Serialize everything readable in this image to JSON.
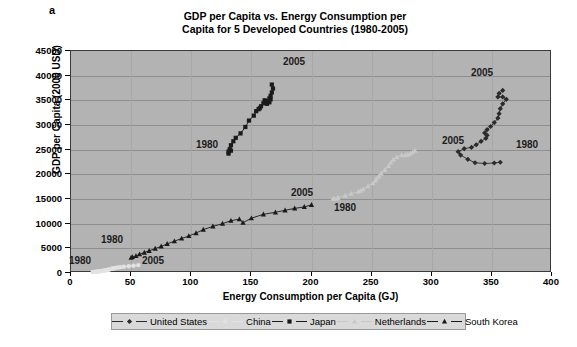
{
  "panel_letter": "a",
  "chart_data": {
    "type": "scatter",
    "title": "GDP per Capita vs. Energy Consumption per Capita for 5 Developed Countries (1980-2005)",
    "title_lines": [
      "GDP per Capita vs. Energy Consumption per",
      "Capita for 5 Developed Countries (1980-2005)"
    ],
    "xlabel": "Energy Consumption per Capita (GJ)",
    "ylabel": "GDP per Capita (2000 USD)",
    "xlim": [
      0,
      400
    ],
    "ylim": [
      0,
      45000
    ],
    "xticks": [
      0,
      50,
      100,
      150,
      200,
      250,
      300,
      350,
      400
    ],
    "yticks": [
      0,
      5000,
      10000,
      15000,
      20000,
      25000,
      30000,
      35000,
      40000,
      45000
    ],
    "grid": "horizontal",
    "legend_position": "bottom",
    "plot_background": "#b3b3b3",
    "series": [
      {
        "name": "United States",
        "marker": "diamond",
        "color": "#2b2b2b",
        "start_label": "1980",
        "end_label": "2005",
        "points": [
          [
            357,
            22450
          ],
          [
            352,
            22300
          ],
          [
            344,
            22200
          ],
          [
            336,
            22350
          ],
          [
            330,
            23050
          ],
          [
            324,
            23900
          ],
          [
            322,
            24600
          ],
          [
            327,
            25200
          ],
          [
            333,
            25450
          ],
          [
            337,
            26000
          ],
          [
            341,
            26700
          ],
          [
            345,
            27300
          ],
          [
            346,
            27900
          ],
          [
            344,
            28400
          ],
          [
            346,
            29050
          ],
          [
            349,
            29700
          ],
          [
            352,
            30500
          ],
          [
            355,
            31400
          ],
          [
            356,
            32300
          ],
          [
            357,
            33300
          ],
          [
            359,
            34300
          ],
          [
            362,
            35200
          ],
          [
            359,
            35700
          ],
          [
            355,
            35700
          ],
          [
            356,
            36400
          ],
          [
            359,
            37000
          ]
        ]
      },
      {
        "name": "China",
        "marker": "circle",
        "color": "#e2e2e2",
        "start_label": "1980",
        "end_label": "2005",
        "points": [
          [
            18,
            190
          ],
          [
            19,
            210
          ],
          [
            20,
            235
          ],
          [
            21,
            260
          ],
          [
            22,
            290
          ],
          [
            23,
            320
          ],
          [
            24,
            355
          ],
          [
            25,
            395
          ],
          [
            26,
            430
          ],
          [
            27,
            470
          ],
          [
            28,
            510
          ],
          [
            29,
            560
          ],
          [
            30,
            610
          ],
          [
            31,
            670
          ],
          [
            32,
            730
          ],
          [
            33,
            790
          ],
          [
            34,
            850
          ],
          [
            35,
            910
          ],
          [
            36,
            970
          ],
          [
            37,
            1040
          ],
          [
            39,
            1110
          ],
          [
            41,
            1190
          ],
          [
            44,
            1280
          ],
          [
            48,
            1380
          ],
          [
            52,
            1480
          ],
          [
            56,
            1600
          ]
        ]
      },
      {
        "name": "Japan",
        "marker": "square",
        "color": "#1a1a1a",
        "start_label": "1980",
        "end_label": "2005",
        "points": [
          [
            133,
            24800
          ],
          [
            131,
            24200
          ],
          [
            131,
            24600
          ],
          [
            132,
            25100
          ],
          [
            133,
            25900
          ],
          [
            135,
            26700
          ],
          [
            137,
            27400
          ],
          [
            141,
            28300
          ],
          [
            145,
            29600
          ],
          [
            148,
            30900
          ],
          [
            152,
            31900
          ],
          [
            154,
            32800
          ],
          [
            156,
            33200
          ],
          [
            157,
            33400
          ],
          [
            158,
            33800
          ],
          [
            160,
            34400
          ],
          [
            161,
            35000
          ],
          [
            162,
            34900
          ],
          [
            163,
            34300
          ],
          [
            165,
            34600
          ],
          [
            166,
            35200
          ],
          [
            165,
            35400
          ],
          [
            166,
            35900
          ],
          [
            167,
            36600
          ],
          [
            168,
            37400
          ],
          [
            167,
            38200
          ]
        ]
      },
      {
        "name": "Netherlands",
        "marker": "triangle",
        "color": "#c8c8c8",
        "start_label": "1980",
        "end_label": "2005",
        "points": [
          [
            222,
            15100
          ],
          [
            219,
            15000
          ],
          [
            218,
            15100
          ],
          [
            222,
            15300
          ],
          [
            228,
            15700
          ],
          [
            233,
            16100
          ],
          [
            239,
            16500
          ],
          [
            241,
            16700
          ],
          [
            243,
            17000
          ],
          [
            247,
            17600
          ],
          [
            251,
            18200
          ],
          [
            253,
            18700
          ],
          [
            254,
            19100
          ],
          [
            256,
            19600
          ],
          [
            258,
            20200
          ],
          [
            261,
            20900
          ],
          [
            264,
            21700
          ],
          [
            266,
            22400
          ],
          [
            268,
            23000
          ],
          [
            271,
            23500
          ],
          [
            275,
            23900
          ],
          [
            278,
            23900
          ],
          [
            280,
            24000
          ],
          [
            282,
            24200
          ],
          [
            284,
            24500
          ],
          [
            286,
            24800
          ]
        ]
      },
      {
        "name": "South Korea",
        "marker": "triangle",
        "color": "#1a1a1a",
        "start_label": "1980",
        "end_label": "2005",
        "points": [
          [
            50,
            3100
          ],
          [
            51,
            3250
          ],
          [
            54,
            3450
          ],
          [
            57,
            3800
          ],
          [
            61,
            4150
          ],
          [
            65,
            4500
          ],
          [
            70,
            4950
          ],
          [
            75,
            5400
          ],
          [
            80,
            5900
          ],
          [
            86,
            6450
          ],
          [
            92,
            7000
          ],
          [
            98,
            7500
          ],
          [
            104,
            8100
          ],
          [
            110,
            8800
          ],
          [
            118,
            9450
          ],
          [
            126,
            10000
          ],
          [
            133,
            10600
          ],
          [
            140,
            10900
          ],
          [
            143,
            10200
          ],
          [
            150,
            11100
          ],
          [
            160,
            11900
          ],
          [
            170,
            12300
          ],
          [
            178,
            12700
          ],
          [
            186,
            13100
          ],
          [
            194,
            13400
          ],
          [
            200,
            13800
          ]
        ]
      }
    ],
    "annotations": [
      {
        "text": "1980",
        "series": "Japan",
        "x_px": 206,
        "y_px": 143
      },
      {
        "text": "2005",
        "series": "Japan",
        "x_px": 293,
        "y_px": 60
      },
      {
        "text": "2005",
        "series": "United States",
        "x_px": 481,
        "y_px": 71
      },
      {
        "text": "1980",
        "series": "United States",
        "x_px": 526,
        "y_px": 143
      },
      {
        "text": "2005",
        "series": "Netherlands",
        "x_px": 452,
        "y_px": 139
      },
      {
        "text": "1980",
        "series": "Netherlands",
        "x_px": 344,
        "y_px": 206
      },
      {
        "text": "1980",
        "series": "South Korea",
        "x_px": 111,
        "y_px": 238
      },
      {
        "text": "2005",
        "series": "South Korea",
        "x_px": 301,
        "y_px": 191
      },
      {
        "text": "1980",
        "series": "China",
        "x_px": 79,
        "y_px": 259
      },
      {
        "text": "2005",
        "series": "China",
        "x_px": 152,
        "y_px": 259
      }
    ]
  },
  "legend": {
    "items": [
      {
        "label": "United States",
        "marker": "diamond",
        "color": "#2b2b2b"
      },
      {
        "label": "China",
        "marker": "circle",
        "color": "#e2e2e2"
      },
      {
        "label": "Japan",
        "marker": "square",
        "color": "#1a1a1a"
      },
      {
        "label": "Netherlands",
        "marker": "triangle",
        "color": "#c8c8c8"
      },
      {
        "label": "South Korea",
        "marker": "triangle",
        "color": "#1a1a1a"
      }
    ]
  }
}
